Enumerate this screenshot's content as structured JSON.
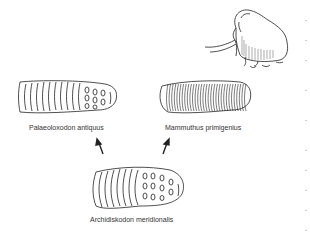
{
  "figure": {
    "illustration": "woolly-mammoth",
    "molars": [
      {
        "id": "palaeoloxodon",
        "label": "Palaeoloxodon antiquus"
      },
      {
        "id": "mammuthus",
        "label": "Mammuthus primigenius"
      },
      {
        "id": "archidiskodon",
        "label": "Archidiskodon meridionalis"
      }
    ],
    "relations": [
      {
        "from": "Archidiskodon meridionalis",
        "to": "Palaeoloxodon antiquus"
      },
      {
        "from": "Archidiskodon meridionalis",
        "to": "Mammuthus primigenius"
      }
    ],
    "colors": {
      "ink": "#222222",
      "background": "#ffffff"
    }
  }
}
